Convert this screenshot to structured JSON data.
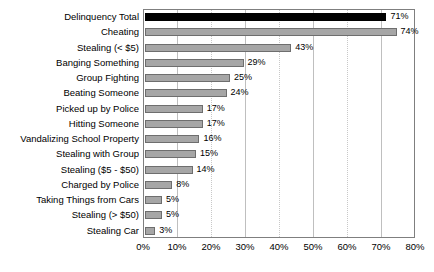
{
  "chart_data": {
    "type": "bar",
    "orientation": "horizontal",
    "title": "",
    "subtitle": "",
    "xlabel": "",
    "ylabel": "",
    "xlim": [
      0,
      80
    ],
    "xtick_step": 10,
    "xticks": [
      "0%",
      "10%",
      "20%",
      "30%",
      "40%",
      "50%",
      "60%",
      "70%",
      "80%"
    ],
    "xtick_values": [
      0,
      10,
      20,
      30,
      40,
      50,
      60,
      70,
      80
    ],
    "grid": true,
    "legend": false,
    "value_suffix": "%",
    "categories": [
      "Delinquency Total",
      "Cheating",
      "Stealing (< $5)",
      "Banging Something",
      "Group Fighting",
      "Beating Someone",
      "Picked up by Police",
      "Hitting Someone",
      "Vandalizing School Property",
      "Stealing with Group",
      "Stealing ($5 - $50)",
      "Charged by Police",
      "Taking Things from Cars",
      "Stealing (> $50)",
      "Stealing Car"
    ],
    "values": [
      71,
      74,
      43,
      29,
      25,
      24,
      17,
      17,
      16,
      15,
      14,
      8,
      5,
      5,
      3
    ],
    "data_labels": [
      "71%",
      "74%",
      "43%",
      "29%",
      "25%",
      "24%",
      "17%",
      "17%",
      "16%",
      "15%",
      "14%",
      "8%",
      "5%",
      "5%",
      "3%"
    ],
    "bar_colors": [
      "#000000",
      "#a6a6a6",
      "#a6a6a6",
      "#a6a6a6",
      "#a6a6a6",
      "#a6a6a6",
      "#a6a6a6",
      "#a6a6a6",
      "#a6a6a6",
      "#a6a6a6",
      "#a6a6a6",
      "#a6a6a6",
      "#a6a6a6",
      "#a6a6a6",
      "#a6a6a6"
    ],
    "colors": {
      "highlight_bar": "#000000",
      "default_bar": "#a6a6a6",
      "bar_border": "#6e6e6e",
      "gridline": "#bfbfbf",
      "plot_border": "#7f7f7f",
      "background": "#ffffff",
      "text": "#000000"
    }
  }
}
